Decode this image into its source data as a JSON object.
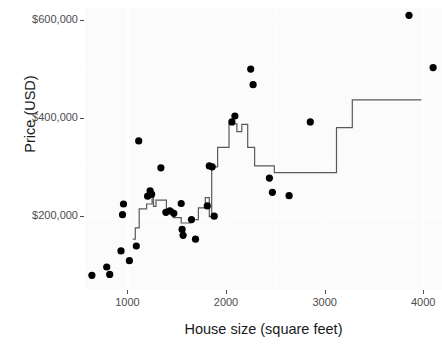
{
  "chart_data": {
    "type": "scatter",
    "title": "",
    "xlabel": "House size (square feet)",
    "ylabel": "Price (USD)",
    "xlim": [
      570,
      4190
    ],
    "ylim": [
      48000,
      625000
    ],
    "grid": true,
    "legend": "none",
    "x_ticks": [
      1000,
      2000,
      3000,
      4000
    ],
    "x_tick_labels": [
      "1000",
      "2000",
      "3000",
      "4000"
    ],
    "y_ticks": [
      200000,
      400000,
      600000
    ],
    "y_tick_labels": [
      "$200,000",
      "$400,000",
      "$600,000"
    ],
    "point_color": "#000000",
    "line_color": "#595959",
    "panel_background": "#fbfbfb",
    "gridline_color": "#ffffff",
    "points": [
      {
        "x": 640,
        "y": 78000
      },
      {
        "x": 790,
        "y": 95000
      },
      {
        "x": 820,
        "y": 80000
      },
      {
        "x": 935,
        "y": 128000
      },
      {
        "x": 950,
        "y": 202000
      },
      {
        "x": 960,
        "y": 224000
      },
      {
        "x": 1020,
        "y": 108000
      },
      {
        "x": 1090,
        "y": 138000
      },
      {
        "x": 1115,
        "y": 353000
      },
      {
        "x": 1205,
        "y": 240000
      },
      {
        "x": 1230,
        "y": 251000
      },
      {
        "x": 1245,
        "y": 244000
      },
      {
        "x": 1340,
        "y": 298000
      },
      {
        "x": 1390,
        "y": 207000
      },
      {
        "x": 1430,
        "y": 210000
      },
      {
        "x": 1470,
        "y": 205000
      },
      {
        "x": 1545,
        "y": 225000
      },
      {
        "x": 1555,
        "y": 172000
      },
      {
        "x": 1565,
        "y": 160000
      },
      {
        "x": 1650,
        "y": 192000
      },
      {
        "x": 1690,
        "y": 152000
      },
      {
        "x": 1810,
        "y": 220000
      },
      {
        "x": 1830,
        "y": 302000
      },
      {
        "x": 1860,
        "y": 300000
      },
      {
        "x": 1880,
        "y": 199000
      },
      {
        "x": 2060,
        "y": 392000
      },
      {
        "x": 2090,
        "y": 404000
      },
      {
        "x": 2250,
        "y": 500000
      },
      {
        "x": 2275,
        "y": 468000
      },
      {
        "x": 2440,
        "y": 277000
      },
      {
        "x": 2470,
        "y": 248000
      },
      {
        "x": 2640,
        "y": 241000
      },
      {
        "x": 2855,
        "y": 392000
      },
      {
        "x": 3855,
        "y": 610000
      },
      {
        "x": 4100,
        "y": 503000
      }
    ],
    "step_line": [
      {
        "x": 1055,
        "y": 152000
      },
      {
        "x": 1080,
        "y": 152000
      },
      {
        "x": 1080,
        "y": 175000
      },
      {
        "x": 1120,
        "y": 175000
      },
      {
        "x": 1120,
        "y": 214000
      },
      {
        "x": 1195,
        "y": 214000
      },
      {
        "x": 1195,
        "y": 224000
      },
      {
        "x": 1250,
        "y": 224000
      },
      {
        "x": 1250,
        "y": 247000
      },
      {
        "x": 1265,
        "y": 247000
      },
      {
        "x": 1265,
        "y": 219000
      },
      {
        "x": 1290,
        "y": 219000
      },
      {
        "x": 1290,
        "y": 232000
      },
      {
        "x": 1395,
        "y": 232000
      },
      {
        "x": 1395,
        "y": 213000
      },
      {
        "x": 1465,
        "y": 213000
      },
      {
        "x": 1465,
        "y": 196000
      },
      {
        "x": 1545,
        "y": 196000
      },
      {
        "x": 1545,
        "y": 185000
      },
      {
        "x": 1640,
        "y": 185000
      },
      {
        "x": 1640,
        "y": 192000
      },
      {
        "x": 1720,
        "y": 192000
      },
      {
        "x": 1720,
        "y": 216000
      },
      {
        "x": 1790,
        "y": 216000
      },
      {
        "x": 1790,
        "y": 237000
      },
      {
        "x": 1830,
        "y": 237000
      },
      {
        "x": 1830,
        "y": 198000
      },
      {
        "x": 1855,
        "y": 198000
      },
      {
        "x": 1855,
        "y": 300000
      },
      {
        "x": 1915,
        "y": 300000
      },
      {
        "x": 1915,
        "y": 340000
      },
      {
        "x": 2030,
        "y": 340000
      },
      {
        "x": 2030,
        "y": 388000
      },
      {
        "x": 2110,
        "y": 388000
      },
      {
        "x": 2110,
        "y": 372000
      },
      {
        "x": 2160,
        "y": 372000
      },
      {
        "x": 2160,
        "y": 387000
      },
      {
        "x": 2220,
        "y": 387000
      },
      {
        "x": 2220,
        "y": 340000
      },
      {
        "x": 2290,
        "y": 340000
      },
      {
        "x": 2290,
        "y": 302000
      },
      {
        "x": 2490,
        "y": 302000
      },
      {
        "x": 2490,
        "y": 288000
      },
      {
        "x": 3120,
        "y": 288000
      },
      {
        "x": 3120,
        "y": 380000
      },
      {
        "x": 3280,
        "y": 380000
      },
      {
        "x": 3280,
        "y": 437000
      },
      {
        "x": 3980,
        "y": 437000
      }
    ]
  }
}
